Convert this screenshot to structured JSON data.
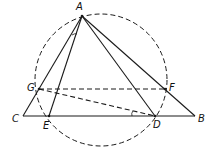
{
  "diagram": {
    "type": "geometry",
    "points": {
      "A": {
        "label": "A",
        "x": 82,
        "y": 16,
        "lx": 76,
        "ly": 2
      },
      "B": {
        "label": "B",
        "x": 195,
        "y": 116,
        "lx": 198,
        "ly": 114
      },
      "C": {
        "label": "C",
        "x": 23,
        "y": 116,
        "lx": 12,
        "ly": 114
      },
      "D": {
        "label": "D",
        "x": 155,
        "y": 116,
        "lx": 153,
        "ly": 120
      },
      "E": {
        "label": "E",
        "x": 49,
        "y": 116,
        "lx": 43,
        "ly": 121
      },
      "F": {
        "label": "F",
        "x": 165,
        "y": 89,
        "lx": 169,
        "ly": 83
      },
      "G": {
        "label": "G",
        "x": 39,
        "y": 89,
        "lx": 27,
        "ly": 83
      }
    },
    "circle": {
      "cx": 101,
      "cy": 80,
      "r": 66,
      "style": "dashed"
    },
    "solid_segments": [
      [
        "A",
        "B"
      ],
      [
        "A",
        "C"
      ],
      [
        "C",
        "B"
      ],
      [
        "A",
        "E"
      ],
      [
        "A",
        "D"
      ]
    ],
    "dashed_segments": [
      [
        "G",
        "F"
      ],
      [
        "G",
        "D"
      ]
    ],
    "angle_marks": [
      {
        "at": "A",
        "between": [
          "C",
          "E"
        ]
      },
      {
        "at": "D",
        "between": [
          "G",
          "C"
        ]
      }
    ],
    "stroke_color": "#1a1a1a"
  }
}
